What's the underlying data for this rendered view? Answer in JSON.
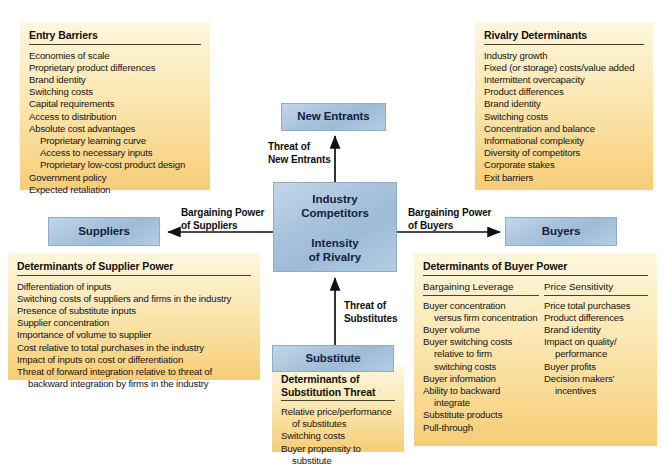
{
  "diagram": {
    "colors": {
      "panel_top": "#fdf7dd",
      "panel_bottom": "#f7cd76",
      "box_blue": "#a9c3dd",
      "text": "#141414",
      "rule": "#4a4230"
    }
  },
  "forces": {
    "new_entrants": "New Entrants",
    "suppliers": "Suppliers",
    "buyers": "Buyers",
    "substitute": "Substitute",
    "center_top": "Industry\nCompetitors",
    "center_top_line1": "Industry",
    "center_top_line2": "Competitors",
    "center_bottom_line1": "Intensity",
    "center_bottom_line2": "of Rivalry"
  },
  "arrows": {
    "threat_new_entrants_l1": "Threat of",
    "threat_new_entrants_l2": "New Entrants",
    "bargaining_suppliers_l1": "Bargaining Power",
    "bargaining_suppliers_l2": "of Suppliers",
    "bargaining_buyers_l1": "Bargaining Power",
    "bargaining_buyers_l2": "of Buyers",
    "threat_substitutes_l1": "Threat of",
    "threat_substitutes_l2": "Substitutes"
  },
  "entry_barriers": {
    "title": "Entry Barriers",
    "items": [
      {
        "text": "Economies of scale",
        "indent": false
      },
      {
        "text": "Proprietary product differences",
        "indent": false
      },
      {
        "text": "Brand identity",
        "indent": false
      },
      {
        "text": "Switching costs",
        "indent": false
      },
      {
        "text": "Capital requirements",
        "indent": false
      },
      {
        "text": "Access to distribution",
        "indent": false
      },
      {
        "text": "Absolute cost advantages",
        "indent": false
      },
      {
        "text": "Proprietary learning curve",
        "indent": true
      },
      {
        "text": "Access to necessary inputs",
        "indent": true
      },
      {
        "text": "Proprietary low-cost product design",
        "indent": true
      },
      {
        "text": "Government policy",
        "indent": false
      },
      {
        "text": "Expected retaliation",
        "indent": false
      }
    ]
  },
  "rivalry_determinants": {
    "title": "Rivalry Determinants",
    "items": [
      {
        "text": "Industry growth",
        "indent": false
      },
      {
        "text": "Fixed (or storage) costs/value added",
        "indent": false
      },
      {
        "text": "Intermittent overcapacity",
        "indent": false
      },
      {
        "text": "Product differences",
        "indent": false
      },
      {
        "text": "Brand identity",
        "indent": false
      },
      {
        "text": "Switching costs",
        "indent": false
      },
      {
        "text": "Concentration and balance",
        "indent": false
      },
      {
        "text": "Informational complexity",
        "indent": false
      },
      {
        "text": "Diversity of competitors",
        "indent": false
      },
      {
        "text": "Corporate stakes",
        "indent": false
      },
      {
        "text": "Exit barriers",
        "indent": false
      }
    ]
  },
  "supplier_power": {
    "title": "Determinants of Supplier Power",
    "items": [
      {
        "text": "Differentiation of inputs",
        "indent": false
      },
      {
        "text": "Switching costs of suppliers and firms in the industry",
        "indent": false
      },
      {
        "text": "Presence of substitute inputs",
        "indent": false
      },
      {
        "text": "Supplier concentration",
        "indent": false
      },
      {
        "text": "Importance of volume to supplier",
        "indent": false
      },
      {
        "text": "Cost relative to total purchases in the industry",
        "indent": false
      },
      {
        "text": "Impact of inputs on cost or differentiation",
        "indent": false
      },
      {
        "text": "Threat of forward integration relative to threat of",
        "indent": false
      },
      {
        "text": "backward integration by firms in the industry",
        "indent": true
      }
    ]
  },
  "buyer_power": {
    "title": "Determinants of Buyer Power",
    "columns": [
      {
        "heading": "Bargaining Leverage",
        "items": [
          {
            "text": "Buyer concentration",
            "indent": false
          },
          {
            "text": "versus firm concentration",
            "indent": true
          },
          {
            "text": "Buyer volume",
            "indent": false
          },
          {
            "text": "Buyer switching costs",
            "indent": false
          },
          {
            "text": "relative to firm",
            "indent": true
          },
          {
            "text": "switching costs",
            "indent": true
          },
          {
            "text": "Buyer information",
            "indent": false
          },
          {
            "text": "Ability to backward",
            "indent": false
          },
          {
            "text": "integrate",
            "indent": true
          },
          {
            "text": "Substitute products",
            "indent": false
          },
          {
            "text": "Pull-through",
            "indent": false
          }
        ]
      },
      {
        "heading": "Price Sensitivity",
        "items": [
          {
            "text": "Price total purchases",
            "indent": false
          },
          {
            "text": "Product differences",
            "indent": false
          },
          {
            "text": "Brand identity",
            "indent": false
          },
          {
            "text": "Impact on quality/",
            "indent": false
          },
          {
            "text": "performance",
            "indent": true
          },
          {
            "text": "Buyer profits",
            "indent": false
          },
          {
            "text": "Decision makers'",
            "indent": false
          },
          {
            "text": "incentives",
            "indent": true
          }
        ]
      }
    ]
  },
  "substitution_threat": {
    "title_line1": "Determinants of",
    "title_line2": "Substitution Threat",
    "items": [
      {
        "text": "Relative price/performance",
        "indent": false
      },
      {
        "text": "of substitutes",
        "indent": true
      },
      {
        "text": "Switching costs",
        "indent": false
      },
      {
        "text": "Buyer propensity to",
        "indent": false
      },
      {
        "text": "substitute",
        "indent": true
      }
    ]
  }
}
